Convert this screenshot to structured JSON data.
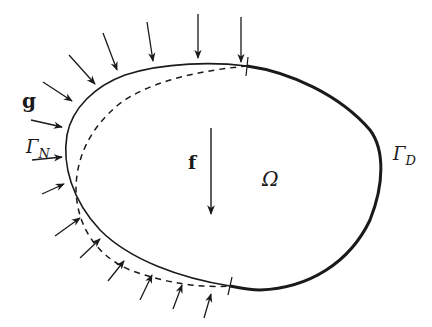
{
  "figure": {
    "labels": {
      "traction": "g",
      "neumann_boundary": "Γ",
      "neumann_sub": "N",
      "dirichlet_boundary": "Γ",
      "dirichlet_sub": "D",
      "body_force": "f",
      "domain": "Ω"
    },
    "colors": {
      "ink": "#1a1a1a",
      "background": "#ffffff"
    },
    "elements": {
      "solid_boundary": "undeformed Neumann boundary Γ_N (thin solid)",
      "dirichlet_boundary": "fixed boundary Γ_D (thick solid)",
      "deformed_boundary": "deformed configuration (dashed)",
      "traction_arrows_count": 15,
      "body_force_arrow_count": 1
    }
  }
}
